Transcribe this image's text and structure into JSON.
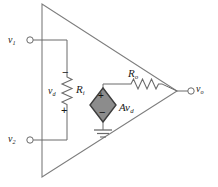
{
  "figure": {
    "type": "circuit-schematic",
    "width": 218,
    "height": 187,
    "background_color": "#ffffff",
    "line_color": "#5a5a5a",
    "wire_color": "#6b6b6b",
    "text_color": "#1a1a1a",
    "source_fill_color": "#8c8c8c",
    "source_border_color": "#3d3d3d"
  },
  "labels": {
    "input_1": {
      "symbol": "v",
      "subscript": "1"
    },
    "input_2": {
      "symbol": "v",
      "subscript": "2"
    },
    "output": {
      "symbol": "v",
      "subscript": "o"
    },
    "differential_voltage": {
      "symbol": "v",
      "subscript": "d"
    },
    "input_resistance": {
      "symbol": "R",
      "subscript": "i"
    },
    "output_resistance": {
      "symbol": "R",
      "subscript": "o"
    },
    "dependent_source": {
      "symbol": "Av",
      "subscript": "d"
    }
  },
  "polarity": {
    "vd_top": "−",
    "vd_bottom": "+",
    "source_top": "+",
    "source_bottom": "−"
  },
  "components": [
    {
      "name": "input-terminal-v1",
      "kind": "terminal",
      "label": "v1"
    },
    {
      "name": "input-terminal-v2",
      "kind": "terminal",
      "label": "v2"
    },
    {
      "name": "output-terminal-vo",
      "kind": "terminal",
      "label": "vo"
    },
    {
      "name": "input-resistor",
      "kind": "resistor",
      "label": "Ri"
    },
    {
      "name": "output-resistor",
      "kind": "resistor",
      "label": "Ro"
    },
    {
      "name": "dependent-voltage-source",
      "kind": "diamond-source",
      "label": "Avd"
    },
    {
      "name": "ground",
      "kind": "ground"
    },
    {
      "name": "amplifier-triangle",
      "kind": "triangle"
    }
  ]
}
